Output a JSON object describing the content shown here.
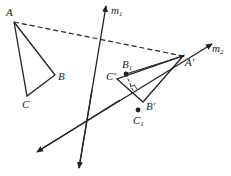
{
  "diagram": {
    "colors": {
      "stroke": "#222222",
      "background": "#ffffff"
    },
    "points": {
      "A": {
        "label": "A",
        "x": 14,
        "y": 22
      },
      "B": {
        "label": "B",
        "x": 55,
        "y": 75
      },
      "C": {
        "label": "C",
        "x": 27,
        "y": 96
      },
      "A_prime": {
        "label": "A'",
        "x": 183,
        "y": 56
      },
      "B_prime": {
        "label": "B'",
        "x": 143,
        "y": 102
      },
      "C_prime": {
        "label": "C'",
        "x": 117,
        "y": 79
      },
      "B1": {
        "label": "B",
        "sub": "1",
        "x": 126,
        "y": 74
      },
      "C1": {
        "label": "C",
        "sub": "1",
        "x": 138,
        "y": 110
      }
    },
    "lines": {
      "m1": {
        "label": "m",
        "sub": "1"
      },
      "m2": {
        "label": "m",
        "sub": "2"
      }
    }
  }
}
